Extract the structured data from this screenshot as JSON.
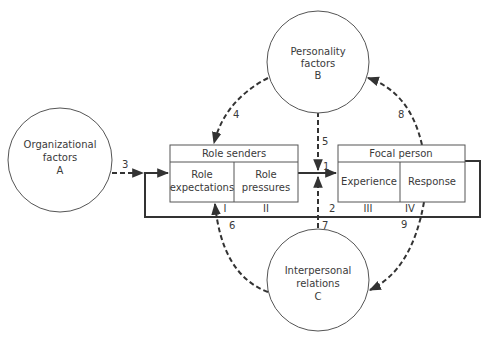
{
  "diagram": {
    "circles": {
      "A": {
        "line1": "Organizational",
        "line2": "factors",
        "letter": "A"
      },
      "B": {
        "line1": "Personality",
        "line2": "factors",
        "letter": "B"
      },
      "C": {
        "line1": "Interpersonal",
        "line2": "relations",
        "letter": "C"
      }
    },
    "role_senders": {
      "header": "Role senders",
      "left": {
        "line1": "Role",
        "line2": "expectations",
        "numeral": "I"
      },
      "right": {
        "line1": "Role",
        "line2": "pressures",
        "numeral": "II"
      }
    },
    "focal_person": {
      "header": "Focal person",
      "left": {
        "label": "Experience",
        "numeral": "III"
      },
      "right": {
        "label": "Response",
        "numeral": "IV"
      }
    },
    "arrows": {
      "a1": "1",
      "a2": "2",
      "a3": "3",
      "a4": "4",
      "a5": "5",
      "a6": "6",
      "a7": "7",
      "a8": "8",
      "a9": "9"
    },
    "colors": {
      "stroke": "#333333",
      "outline": "#555555",
      "text": "#3a3a3a",
      "background": "#ffffff"
    }
  }
}
